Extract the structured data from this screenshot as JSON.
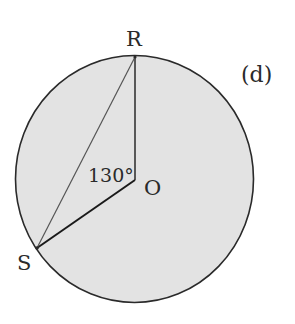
{
  "figure": {
    "panel_label": "(d)",
    "center_label": "O",
    "angle_label": "130°",
    "points": {
      "top": "R",
      "lower_left": "S"
    },
    "colors": {
      "circle_fill": "#e3e3e3",
      "stroke": "#2a2a2a",
      "background": "#ffffff"
    }
  }
}
